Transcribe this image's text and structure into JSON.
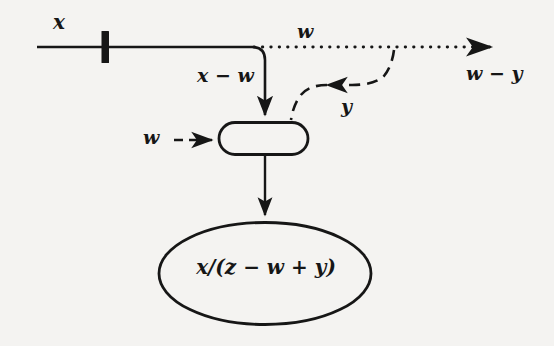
{
  "diagram": {
    "type": "dataflow-diagram",
    "background_color": "#f4f3f1",
    "ink_color": "#161616",
    "labels": {
      "input_x": "x",
      "branch_x_minus_w": "x − w",
      "top_w": "w",
      "left_w": "w",
      "feedback_y": "y",
      "output_w_minus_y": "w − y",
      "result_expression": "x/(z − w + y)"
    },
    "nodes": [
      {
        "name": "process-box",
        "shape": "rounded-rectangle",
        "label": "",
        "x": 218,
        "y": 122,
        "width": 90,
        "height": 33
      },
      {
        "name": "result-ellipse",
        "shape": "ellipse",
        "label": "x/(z − w + y)",
        "cx": 265,
        "cy": 273,
        "rx": 107,
        "ry": 51
      },
      {
        "name": "tap-bar",
        "shape": "thick-vertical-bar",
        "label": "",
        "x": 103,
        "y": 32,
        "width": 7,
        "height": 30
      }
    ],
    "edges": [
      {
        "name": "input-line",
        "style": "solid",
        "from": "x",
        "to": "bend",
        "arrow": false
      },
      {
        "name": "branch-down-to-box",
        "style": "solid",
        "from": "bend",
        "to": "process-box",
        "arrow": true,
        "label": "x − w"
      },
      {
        "name": "w-dotted-through",
        "style": "dotted",
        "from": "bend",
        "to": "output",
        "arrow": true,
        "label": "w"
      },
      {
        "name": "y-feedback",
        "style": "dashed",
        "from": "w-dotted-through",
        "to": "process-box",
        "arrow": true,
        "label": "y"
      },
      {
        "name": "w-input-dashed",
        "style": "dashed",
        "from": "w",
        "to": "process-box",
        "arrow": true,
        "label": "w"
      },
      {
        "name": "box-to-ellipse",
        "style": "solid",
        "from": "process-box",
        "to": "result-ellipse",
        "arrow": true
      }
    ]
  }
}
